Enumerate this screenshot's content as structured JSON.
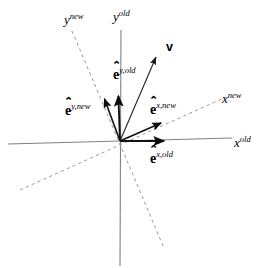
{
  "figure": {
    "width": 262,
    "height": 268,
    "background": "#ffffff",
    "origin": {
      "x": 120,
      "y": 141
    },
    "colors": {
      "axis_old": "#808080",
      "axis_new_dashed": "#9a9a9a",
      "vector": "#1a1a1a",
      "basis_arrow": "#111111",
      "text": "#000000"
    }
  },
  "axes": [
    {
      "id": "x-old",
      "label_base": "x",
      "label_sup": "old",
      "style": "solid",
      "color": "#808080",
      "x1": 8,
      "y1": 144,
      "x2": 232,
      "y2": 138,
      "label_x": 234,
      "label_y": 136
    },
    {
      "id": "y-old",
      "label_base": "y",
      "label_sup": "old",
      "style": "solid",
      "color": "#808080",
      "x1": 121,
      "y1": 30,
      "x2": 120,
      "y2": 266,
      "label_x": 113,
      "label_y": 10
    },
    {
      "id": "x-new",
      "label_base": "x",
      "label_sup": "new",
      "style": "dashed",
      "color": "#9a9a9a",
      "x1": 20,
      "y1": 190,
      "x2": 226,
      "y2": 97,
      "label_x": 222,
      "label_y": 92
    },
    {
      "id": "y-new",
      "label_base": "y",
      "label_sup": "new",
      "style": "dashed",
      "color": "#9a9a9a",
      "x1": 72,
      "y1": 31,
      "x2": 164,
      "y2": 248,
      "label_x": 64,
      "label_y": 13
    }
  ],
  "basis_vectors": [
    {
      "id": "e-x-old",
      "symbol": "e",
      "hat": "⌃",
      "sup": "x,old",
      "x1": 120,
      "y1": 141,
      "x2": 170,
      "y2": 141,
      "label_x": 152,
      "label_y": 152
    },
    {
      "id": "e-y-old",
      "symbol": "e",
      "hat": "⌃",
      "sup": "y,old",
      "x1": 120,
      "y1": 141,
      "x2": 118,
      "y2": 90,
      "label_x": 117,
      "label_y": 68
    },
    {
      "id": "e-x-new",
      "symbol": "e",
      "hat": "⌃",
      "sup": "x,new",
      "x1": 120,
      "y1": 141,
      "x2": 167,
      "y2": 120,
      "label_x": 152,
      "label_y": 103
    },
    {
      "id": "e-y-new",
      "symbol": "e",
      "hat": "⌃",
      "sup": "y,new",
      "x1": 120,
      "y1": 141,
      "x2": 102,
      "y2": 93,
      "label_x": 65,
      "label_y": 104
    }
  ],
  "vectors": [
    {
      "id": "v",
      "label": "v",
      "x1": 120,
      "y1": 141,
      "x2": 159,
      "y2": 50,
      "label_x": 166,
      "label_y": 41
    }
  ]
}
